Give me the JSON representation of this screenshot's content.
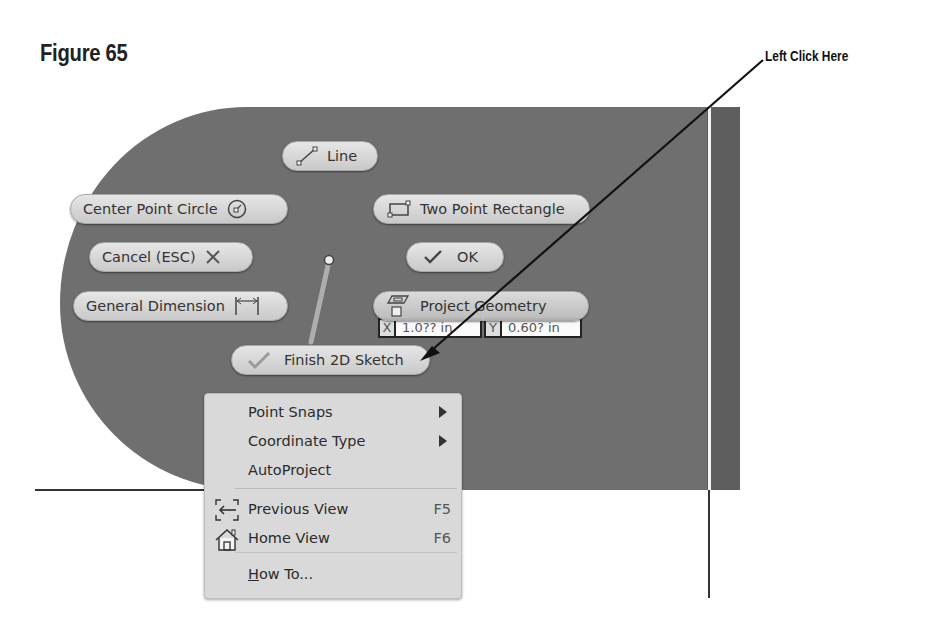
{
  "figure": {
    "title": "Figure 65",
    "callout": "Left Click Here"
  },
  "marking_menu": {
    "buttons": {
      "line": "Line",
      "center_point_circle": "Center Point Circle",
      "two_point_rectangle": "Two Point Rectangle",
      "cancel": "Cancel (ESC)",
      "ok": "OK",
      "general_dimension": "General Dimension",
      "project_geometry": "Project Geometry",
      "finish_2d_sketch": "Finish 2D Sketch"
    }
  },
  "coordinate_input": {
    "x_label": "X",
    "x_value": "1.0?? in",
    "y_label": "Y",
    "y_value": "0.60? in"
  },
  "context_menu": {
    "items": [
      {
        "label": "Point Snaps",
        "submenu": true
      },
      {
        "label": "Coordinate Type",
        "submenu": true
      },
      {
        "label": "AutoProject",
        "submenu": false
      },
      {
        "label": "Previous View",
        "shortcut": "F5",
        "icon": "previous-view-icon"
      },
      {
        "label": "Home View",
        "shortcut": "F6",
        "icon": "home-view-icon"
      },
      {
        "label_underlined": "H",
        "label_rest": "ow To..."
      }
    ]
  },
  "colors": {
    "canvas": "#6f6f6f",
    "pill": "#d6d6d6",
    "menu": "#d9d9d9",
    "text": "#333333"
  }
}
